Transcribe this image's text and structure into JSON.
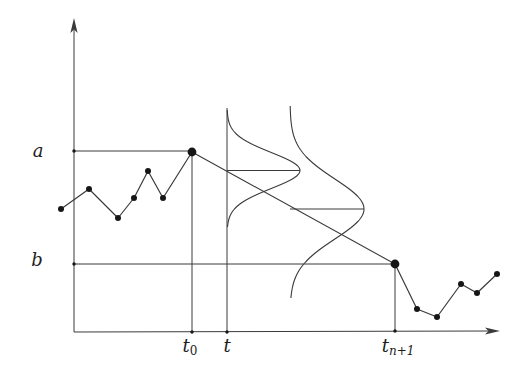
{
  "figure": {
    "background": "#ffffff",
    "ink": "#3a3a3a",
    "dot_color": "#161616",
    "labels": {
      "y_upper": "a",
      "y_lower": "b",
      "t0_base": "t",
      "t0_sub": "0",
      "t_mid": "t",
      "tn1_base": "t",
      "tn1_sub": "n+1"
    },
    "axes": {
      "origin": [
        74,
        332
      ],
      "y_shaft_top": [
        74,
        30
      ],
      "y_arrow_tip": [
        74,
        18
      ],
      "x_shaft_end": [
        488,
        331
      ],
      "x_arrow_tip": [
        500,
        331
      ]
    },
    "levels": [
      {
        "name": "level-a",
        "y": 151,
        "x_from": 74,
        "x_to": 192
      },
      {
        "name": "level-b",
        "y": 264,
        "x_from": 74,
        "x_to": 395
      }
    ],
    "verticals": [
      {
        "name": "vertical-t0",
        "x": 192,
        "y_from": 152,
        "y_to": 332
      },
      {
        "name": "vertical-t",
        "x": 227,
        "y_from": 108,
        "y_to": 332
      },
      {
        "name": "vertical-tn1",
        "x": 395,
        "y_from": 264,
        "y_to": 331
      }
    ],
    "bridge_line": {
      "from": [
        192,
        152
      ],
      "to": [
        395,
        264
      ]
    },
    "sample_path_left": [
      [
        61,
        209
      ],
      [
        89,
        189
      ],
      [
        118,
        218
      ],
      [
        134,
        198
      ],
      [
        148,
        171
      ],
      [
        163,
        198
      ],
      [
        192,
        152
      ]
    ],
    "sample_path_right": [
      [
        395,
        264
      ],
      [
        417,
        309
      ],
      [
        437,
        317
      ],
      [
        461,
        284
      ],
      [
        477,
        293
      ],
      [
        497,
        274
      ]
    ],
    "anchor_points": [
      [
        192,
        152
      ],
      [
        395,
        264
      ]
    ],
    "tick_dots": [
      [
        74,
        151
      ],
      [
        74,
        264
      ],
      [
        192,
        332
      ],
      [
        227,
        332
      ],
      [
        395,
        331
      ]
    ],
    "densities": [
      {
        "name": "density-narrow",
        "base_x": 227,
        "mean_y": 170.5,
        "amplitude": 73,
        "sigma": 18,
        "y_from": 110,
        "y_to": 228
      },
      {
        "name": "density-wide",
        "base_x": 290,
        "mean_y": 209,
        "amplitude": 74,
        "sigma": 30,
        "y_from": 106,
        "y_to": 298
      }
    ]
  }
}
